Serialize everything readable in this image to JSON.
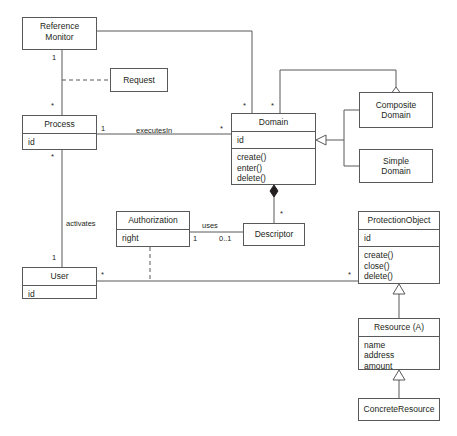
{
  "diagram": {
    "kind": "uml-class-diagram",
    "line_color": "#58595b",
    "text_color": "#231f20",
    "background": "#ffffff",
    "classes": [
      {
        "id": "reference-monitor",
        "name": "Reference\nMonitor",
        "name_lines": [
          "Reference",
          "Monitor"
        ],
        "attributes": [],
        "operations": []
      },
      {
        "id": "request",
        "name": "Request",
        "name_lines": [
          "Request"
        ],
        "attributes": [],
        "operations": []
      },
      {
        "id": "process",
        "name": "Process",
        "name_lines": [
          "Process"
        ],
        "attributes": [
          "id"
        ],
        "operations": []
      },
      {
        "id": "domain",
        "name": "Domain",
        "name_lines": [
          "Domain"
        ],
        "attributes": [
          "id"
        ],
        "operations": [
          "create()",
          "enter()",
          "delete()"
        ]
      },
      {
        "id": "composite-domain",
        "name": "Composite Domain",
        "name_lines": [
          "Composite",
          "Domain"
        ],
        "attributes": [],
        "operations": []
      },
      {
        "id": "simple-domain",
        "name": "Simple Domain",
        "name_lines": [
          "Simple",
          "Domain"
        ],
        "attributes": [],
        "operations": []
      },
      {
        "id": "authorization",
        "name": "Authorization",
        "name_lines": [
          "Authorization"
        ],
        "attributes": [
          "right"
        ],
        "operations": []
      },
      {
        "id": "descriptor",
        "name": "Descriptor",
        "name_lines": [
          "Descriptor"
        ],
        "attributes": [],
        "operations": []
      },
      {
        "id": "user",
        "name": "User",
        "name_lines": [
          "User"
        ],
        "attributes": [
          "id"
        ],
        "operations": []
      },
      {
        "id": "protection-object",
        "name": "ProtectionObject",
        "name_lines": [
          "ProtectionObject"
        ],
        "attributes": [
          "id"
        ],
        "operations": [
          "create()",
          "close()",
          "delete()"
        ]
      },
      {
        "id": "resource",
        "name": "Resource (A)",
        "name_lines": [
          "Resource (A)"
        ],
        "attributes": [
          "name",
          "address",
          "amount"
        ],
        "operations": []
      },
      {
        "id": "concrete-resource",
        "name": "ConcreteResource",
        "name_lines": [
          "ConcreteResource"
        ],
        "attributes": [],
        "operations": []
      }
    ],
    "edge_labels": {
      "rm_process_one": "1",
      "rm_process_star": "*",
      "process_executes_in": "executesIn",
      "process_executes_one": "1",
      "domain_executes_star": "*",
      "domain_top_left_star": "*",
      "domain_top_right_star": "*",
      "process_activates_star": "*",
      "activates": "activates",
      "user_activates_one": "1",
      "authorization_uses_one": "1",
      "uses": "uses",
      "descriptor_uses_mult": "0..1",
      "descriptor_domain_star": "*",
      "user_protection_star": "*",
      "protection_user_star": "*"
    }
  }
}
